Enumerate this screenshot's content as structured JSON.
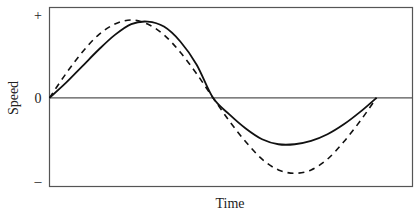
{
  "chart_data": {
    "type": "line",
    "title": "",
    "xlabel": "Time",
    "ylabel": "Speed",
    "xlim": [
      0,
      1.11
    ],
    "ylim": [
      -1.07,
      1.09
    ],
    "y_tick_labels": [
      {
        "value": 1,
        "label": "+"
      },
      {
        "value": 0,
        "label": "0"
      },
      {
        "value": -1,
        "label": "–"
      }
    ],
    "grid": false,
    "legend": "none",
    "zero_line": true,
    "series": [
      {
        "name": "solid",
        "style": "solid",
        "color": "#111111",
        "x": [
          0,
          0.05,
          0.1,
          0.15,
          0.2,
          0.25,
          0.3,
          0.35,
          0.4,
          0.45,
          0.5,
          0.55,
          0.6,
          0.65,
          0.7,
          0.75,
          0.8,
          0.85,
          0.9,
          0.95,
          1.0
        ],
        "values": [
          0,
          0.18,
          0.38,
          0.58,
          0.76,
          0.89,
          0.92,
          0.86,
          0.68,
          0.4,
          0.0,
          -0.2,
          -0.37,
          -0.5,
          -0.56,
          -0.56,
          -0.52,
          -0.44,
          -0.32,
          -0.17,
          0
        ]
      },
      {
        "name": "dashed",
        "style": "dashed",
        "color": "#111111",
        "x": [
          0,
          0.05,
          0.1,
          0.15,
          0.2,
          0.25,
          0.3,
          0.35,
          0.4,
          0.45,
          0.5,
          0.55,
          0.6,
          0.65,
          0.7,
          0.75,
          0.8,
          0.85,
          0.9,
          0.95,
          1.0
        ],
        "values": [
          0,
          0.29,
          0.55,
          0.76,
          0.89,
          0.94,
          0.89,
          0.76,
          0.55,
          0.29,
          0.0,
          -0.28,
          -0.53,
          -0.74,
          -0.87,
          -0.91,
          -0.87,
          -0.74,
          -0.53,
          -0.28,
          0
        ]
      }
    ]
  }
}
